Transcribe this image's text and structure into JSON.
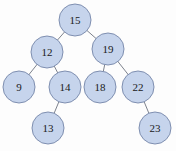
{
  "diagram": {
    "type": "binary-search-tree",
    "colors": {
      "node_fill": "#c6d4ec",
      "node_stroke": "#7f8fb0",
      "edge": "#6e7480",
      "text": "#1a1a1a"
    },
    "node_radius": 16,
    "nodes": [
      {
        "id": "n15",
        "label": "15",
        "x": 75,
        "y": 20
      },
      {
        "id": "n12",
        "label": "12",
        "x": 47,
        "y": 52
      },
      {
        "id": "n19",
        "label": "19",
        "x": 108,
        "y": 49
      },
      {
        "id": "n9",
        "label": "9",
        "x": 19,
        "y": 87
      },
      {
        "id": "n14",
        "label": "14",
        "x": 65,
        "y": 87
      },
      {
        "id": "n18",
        "label": "18",
        "x": 100,
        "y": 87
      },
      {
        "id": "n22",
        "label": "22",
        "x": 138,
        "y": 87
      },
      {
        "id": "n13",
        "label": "13",
        "x": 48,
        "y": 128
      },
      {
        "id": "n23",
        "label": "23",
        "x": 155,
        "y": 128
      }
    ],
    "edges": [
      {
        "from": "n15",
        "to": "n12"
      },
      {
        "from": "n15",
        "to": "n19"
      },
      {
        "from": "n12",
        "to": "n9"
      },
      {
        "from": "n12",
        "to": "n14"
      },
      {
        "from": "n19",
        "to": "n18"
      },
      {
        "from": "n19",
        "to": "n22"
      },
      {
        "from": "n14",
        "to": "n13"
      },
      {
        "from": "n22",
        "to": "n23"
      }
    ]
  }
}
